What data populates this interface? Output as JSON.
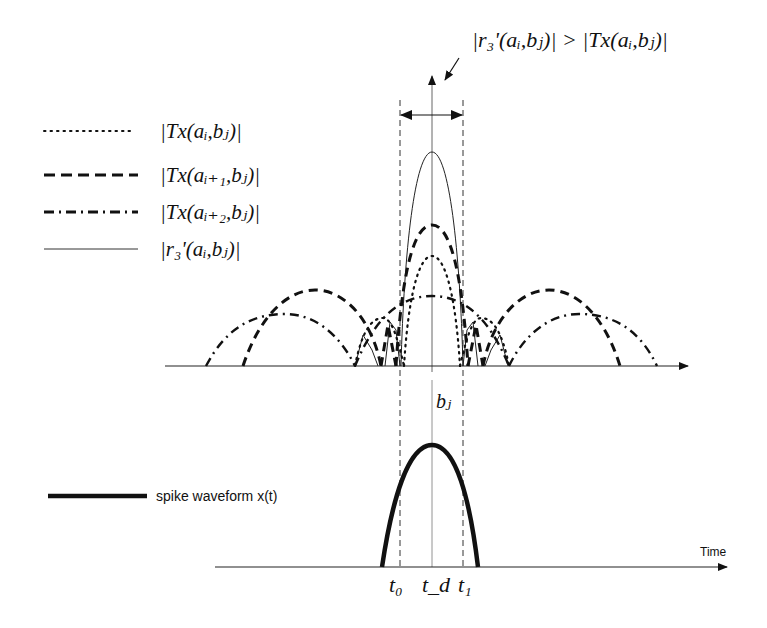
{
  "annotation": {
    "top_inequality": "|r₃'(aᵢ,bⱼ)| > |Tx(aᵢ,bⱼ)|"
  },
  "legend": {
    "items": [
      {
        "style": "dotted",
        "label": "|Tx(aᵢ,bⱼ)|"
      },
      {
        "style": "dashed",
        "label": "|Tx(aᵢ₊₁,bⱼ)|"
      },
      {
        "style": "dash-dot",
        "label": "|Tx(aᵢ₊₂,bⱼ)|"
      },
      {
        "style": "solid-thin",
        "label": "|r₃'(aᵢ,bⱼ)|"
      }
    ],
    "spike_label": "spike waveform x(t)"
  },
  "axes": {
    "top_center_label": "bⱼ",
    "bottom_axis_label": "Time",
    "bottom_ticks": [
      "t₀",
      "t_d",
      "t₁"
    ]
  },
  "colors": {
    "ink": "#111111",
    "guide": "#555555",
    "background": "#ffffff"
  }
}
